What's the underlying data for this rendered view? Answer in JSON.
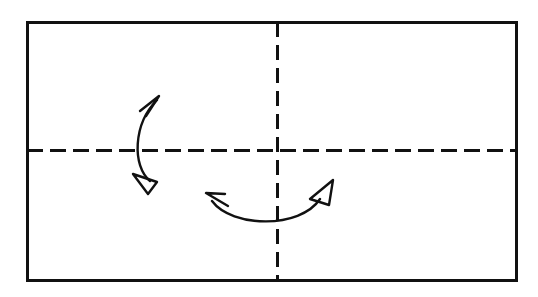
{
  "figure": {
    "kind": "origami-fold-instruction-diagram",
    "title": "",
    "caption": "",
    "background_color": "#ffffff",
    "ink_color": "#111111",
    "canvas": {
      "width": 538,
      "height": 297
    }
  },
  "sheet": {
    "label": "paper-sheet-outline",
    "shape": "rectangle",
    "fill": "#ffffff",
    "stroke_color": "#111111",
    "stroke_width": 3,
    "x": 27,
    "y": 22,
    "width": 489,
    "height": 258
  },
  "crease_lines": [
    {
      "label": "horizontal-center-crease",
      "orientation": "horizontal",
      "style": "dashed",
      "stroke_color": "#111111",
      "stroke_width": 3,
      "dash": "16 7",
      "x1": 27,
      "y1": 150,
      "x2": 516,
      "y2": 150
    },
    {
      "label": "vertical-center-crease",
      "orientation": "vertical",
      "style": "dashed",
      "stroke_color": "#111111",
      "stroke_width": 3,
      "dash": "15 8",
      "x1": 277,
      "y1": 22,
      "x2": 277,
      "y2": 280
    }
  ],
  "arrows": [
    {
      "label": "vertical-double-fold-arrow",
      "description": "curved double-headed arrow spanning the horizontal crease, indicating an up-and-down fold",
      "stroke_color": "#111111",
      "stroke_width": 2.4,
      "path": "M 150,181 C 132,166 133,124 157,100",
      "head_start": {
        "style": "open-triangle",
        "points": "157,182 133,174 148,194",
        "direction": "down-right"
      },
      "head_end": {
        "style": "barb",
        "points": "140,111 159,96 146,116",
        "direction": "up-right"
      }
    },
    {
      "label": "horizontal-double-fold-arrow",
      "description": "U-shaped double-headed arrow crossing the vertical crease, indicating a left-and-right fold",
      "stroke_color": "#111111",
      "stroke_width": 2.4,
      "path": "M 212,201 C 232,228 300,229 320,199",
      "head_start": {
        "style": "barb",
        "points": "228,206 206,193 225,194",
        "direction": "up-left"
      },
      "head_end": {
        "style": "open-triangle",
        "points": "333,180 310,199 329,205",
        "direction": "up-right"
      }
    }
  ]
}
